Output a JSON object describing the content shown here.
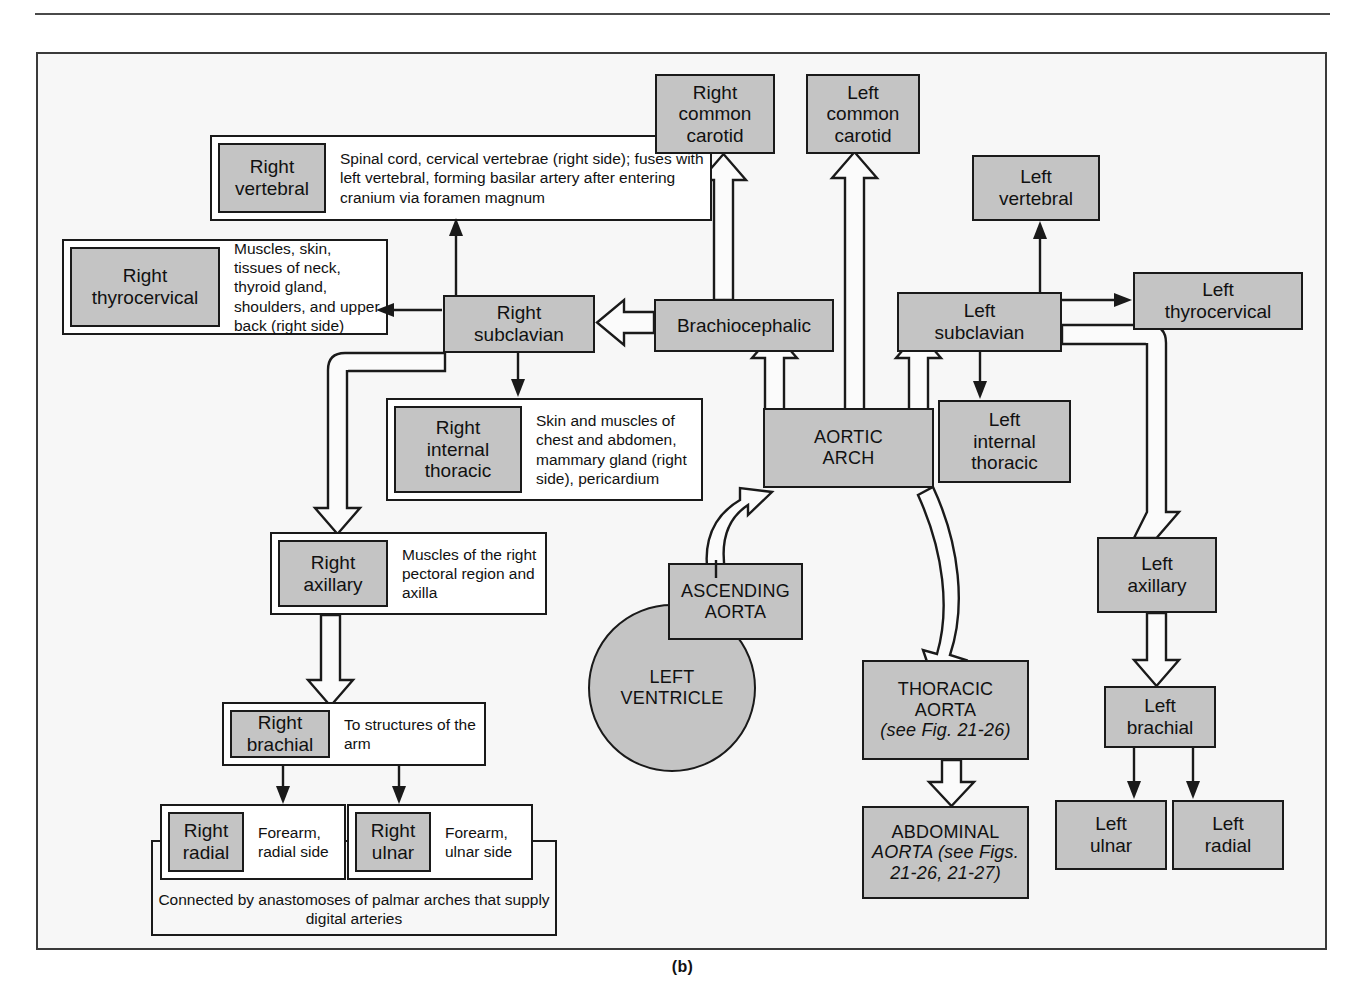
{
  "figure": {
    "caption": "(b)"
  },
  "nodes": {
    "right_vertebral": {
      "label": "Right\nvertebral",
      "desc": "Spinal cord, cervical vertebrae (right side); fuses with left vertebral, forming basilar artery after entering cranium via foramen magnum"
    },
    "right_thyrocervical": {
      "label": "Right\nthyrocervical",
      "desc": "Muscles, skin, tissues of neck, thyroid gland, shoulders, and upper back (right side)"
    },
    "right_internal_thoracic": {
      "label": "Right\ninternal\nthoracic",
      "desc": "Skin and muscles of chest and abdomen, mammary gland (right side), pericardium"
    },
    "right_axillary": {
      "label": "Right\naxillary",
      "desc": "Muscles of the right pectoral region and axilla"
    },
    "right_brachial": {
      "label": "Right\nbrachial",
      "desc": "To structures of the arm"
    },
    "right_radial": {
      "label": "Right\nradial",
      "desc": "Forearm, radial side"
    },
    "right_ulnar": {
      "label": "Right\nulnar",
      "desc": "Forearm, ulnar side"
    },
    "right_subclavian": {
      "label": "Right\nsubclavian"
    },
    "brachiocephalic": {
      "label": "Brachiocephalic"
    },
    "right_common_carotid": {
      "label": "Right\ncommon\ncarotid"
    },
    "left_common_carotid": {
      "label": "Left\ncommon\ncarotid"
    },
    "left_vertebral": {
      "label": "Left\nvertebral"
    },
    "left_subclavian": {
      "label": "Left\nsubclavian"
    },
    "left_thyrocervical": {
      "label": "Left\nthyrocervical"
    },
    "left_internal_thoracic": {
      "label": "Left\ninternal\nthoracic"
    },
    "aortic_arch": {
      "label": "AORTIC\nARCH"
    },
    "ascending_aorta": {
      "label": "ASCENDING\nAORTA"
    },
    "left_ventricle": {
      "label": "LEFT\nVENTRICLE"
    },
    "thoracic_aorta": {
      "label": "THORACIC\nAORTA",
      "ref": "(see Fig. 21-26)"
    },
    "abdominal_aorta": {
      "label": "ABDOMINAL",
      "ref_line1": "AORTA (see Figs.",
      "ref_line2": "21-26, 21-27)"
    },
    "left_axillary": {
      "label": "Left\naxillary"
    },
    "left_brachial": {
      "label": "Left\nbrachial"
    },
    "left_ulnar": {
      "label": "Left\nulnar"
    },
    "left_radial": {
      "label": "Left\nradial"
    },
    "anastomosis_note": {
      "text": "Connected by anastomoses of palmar arches that supply digital arteries"
    }
  },
  "colors": {
    "node_fill": "#c4c4c4",
    "node_stroke": "#1a1a1a",
    "panel_bg": "#f7f7f7",
    "page_bg": "#ffffff"
  }
}
